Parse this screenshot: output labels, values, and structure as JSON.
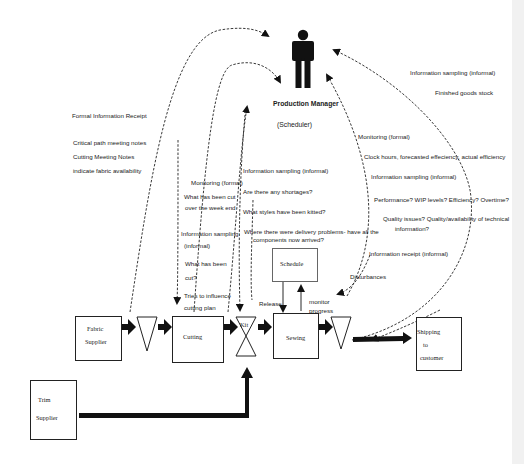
{
  "manager": {
    "title": "Production Manager",
    "subtitle": "(Scheduler)",
    "icon": "person-icon"
  },
  "left_annotations": {
    "formal_receipt": "Formal Information Receipt",
    "items": [
      "Critical path meeting notes",
      "Cutting Meeting Notes",
      "indicate fabric availability"
    ]
  },
  "cutting_annotations": {
    "monitoring": "Monitoring (formal)",
    "what_cut_1": "What has been cut",
    "what_cut_2": "over the week end",
    "sampling_1": "Information sampling",
    "sampling_2": "(informal)",
    "what_cut_3": "What has been",
    "what_cut_4": "cut?",
    "influence_1": "Tries to influence",
    "influence_2": "cutting plan"
  },
  "kit_annotations": {
    "sampling": "Information sampling (informal)",
    "q1": "Are there any shortages?",
    "q2": "What styles have been kitted?",
    "q3_1": "Where there were delivery problems- have all the",
    "q3_2": "components now arrived?"
  },
  "sewing_annotations": {
    "monitoring": "Monitoring (formal)",
    "clock": "Clock hours, forecasted effeciency, actual efficiency",
    "sampling": "Information sampling (informal)",
    "performance": "Performance? WIP levels? Efficiency? Overtime?",
    "quality_1": "Quality issues? Quality/availability of technical",
    "quality_2": "information?",
    "receipt": "Information receipt (informal)",
    "disturbances": "Disturbances"
  },
  "shipping_annotations": {
    "sampling": "Information sampling (informal)",
    "finished": "Finished goods stock"
  },
  "schedule": {
    "label": "Schedule",
    "release": "Release",
    "monitor_1": "monitor",
    "monitor_2": "progress"
  },
  "flow": {
    "fabric_1": "Fabric",
    "fabric_2": "Supplier",
    "cutting": "Cutting",
    "kit": "Kit",
    "sewing": "Sewing",
    "shipping_1": "Shipping",
    "shipping_2": "to",
    "shipping_3": "customer",
    "trim_1": "Trim",
    "trim_2": "Supplier"
  }
}
